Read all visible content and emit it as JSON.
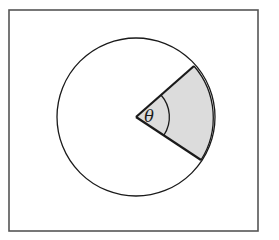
{
  "diagram": {
    "angle_label": "θ",
    "colors": {
      "stroke": "#1a1a1a",
      "frame": "#555555",
      "sector_fill": "#dcdcdc",
      "background": "#ffffff"
    },
    "circle": {
      "cx": 136,
      "cy": 117,
      "r": 79
    },
    "sector": {
      "start_point": [
        191,
        66
      ],
      "end_point": [
        201,
        160
      ]
    },
    "angle_arc_radius": 33
  }
}
